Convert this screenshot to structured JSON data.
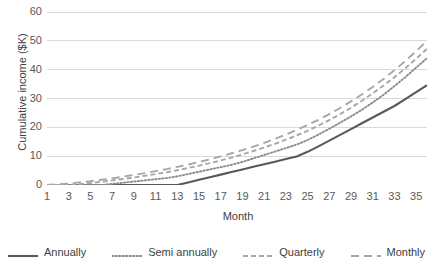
{
  "chart_data": {
    "type": "line",
    "title": "",
    "xlabel": "Month",
    "ylabel": "Cumulative income ($K)",
    "xlim": [
      1,
      36
    ],
    "ylim": [
      0,
      60
    ],
    "ytick_step": 10,
    "grid": "horizontal",
    "legend_position": "bottom",
    "x": [
      1,
      2,
      3,
      4,
      5,
      6,
      7,
      8,
      9,
      10,
      11,
      12,
      13,
      14,
      15,
      16,
      17,
      18,
      19,
      20,
      21,
      22,
      23,
      24,
      25,
      26,
      27,
      28,
      29,
      30,
      31,
      32,
      33,
      34,
      35,
      36
    ],
    "xtick_labels": [
      "1",
      "3",
      "5",
      "7",
      "9",
      "11",
      "13",
      "15",
      "17",
      "19",
      "21",
      "23",
      "25",
      "27",
      "29",
      "31",
      "33",
      "35"
    ],
    "ytick_labels": [
      "0",
      "10",
      "20",
      "30",
      "40",
      "50",
      "60"
    ],
    "series": [
      {
        "name": "Annually",
        "style": "solid",
        "color": "#595959",
        "values": [
          0,
          0,
          0,
          0,
          0,
          0,
          0,
          0,
          0,
          0,
          0,
          0,
          0,
          0.9,
          1.8,
          2.7,
          3.6,
          4.5,
          5.4,
          6.3,
          7.2,
          8.1,
          9.0,
          9.9,
          11.5,
          13.4,
          15.4,
          17.4,
          19.4,
          21.4,
          23.4,
          25.4,
          27.4,
          29.8,
          32.2,
          34.6
        ]
      },
      {
        "name": "Semi annually",
        "style": "dotted",
        "color": "#8c8c8c",
        "values": [
          0,
          0,
          0,
          0,
          0,
          0,
          0.4,
          0.8,
          1.2,
          1.6,
          2.0,
          2.4,
          3.0,
          3.8,
          4.6,
          5.4,
          6.2,
          7.0,
          8.0,
          9.2,
          10.4,
          11.6,
          12.8,
          14.0,
          15.6,
          17.5,
          19.5,
          21.6,
          23.8,
          26.1,
          28.6,
          31.3,
          34.3,
          37.4,
          40.7,
          44.0
        ]
      },
      {
        "name": "Quarterly",
        "style": "dashed-short",
        "color": "#a6a6a6",
        "values": [
          0,
          0,
          0,
          0.3,
          0.7,
          1.1,
          1.6,
          2.1,
          2.6,
          3.2,
          3.8,
          4.4,
          5.1,
          5.9,
          6.7,
          7.6,
          8.5,
          9.5,
          10.6,
          11.8,
          13.0,
          14.3,
          15.7,
          17.2,
          18.8,
          20.6,
          22.5,
          24.6,
          26.8,
          29.2,
          31.8,
          34.5,
          37.4,
          40.5,
          43.8,
          47.2
        ]
      },
      {
        "name": "Monthly",
        "style": "dashed-long",
        "color": "#a6a6a6",
        "values": [
          0,
          0.2,
          0.5,
          0.9,
          1.3,
          1.8,
          2.3,
          2.9,
          3.5,
          4.1,
          4.8,
          5.5,
          6.3,
          7.1,
          8.0,
          8.9,
          9.9,
          11.0,
          12.1,
          13.3,
          14.6,
          16.0,
          17.5,
          19.1,
          20.8,
          22.6,
          24.6,
          26.7,
          29.0,
          31.4,
          34.0,
          36.8,
          39.8,
          43.0,
          46.4,
          50.0
        ]
      }
    ]
  },
  "legend": {
    "items": [
      {
        "label": "Annually"
      },
      {
        "label": "Semi annually"
      },
      {
        "label": "Quarterly"
      },
      {
        "label": "Monthly"
      }
    ]
  }
}
